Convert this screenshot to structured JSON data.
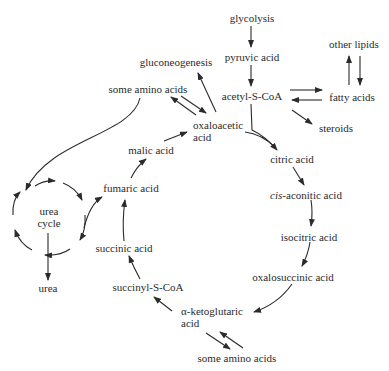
{
  "diagram": {
    "title": "",
    "nodes": {
      "glycolysis": "glycolysis",
      "pyruvic_acid": "pyruvic acid",
      "acetyl_scoa": "acetyl-S-CoA",
      "other_lipids": "other lipids",
      "fatty_acids": "fatty acids",
      "steroids": "steroids",
      "gluconeogenesis": "gluconeogenesis",
      "some_amino_acids_top": "some amino acids",
      "oxaloacetic_1": "oxaloacetic",
      "oxaloacetic_2": "acid",
      "citric_acid": "citric acid",
      "cis_prefix": "cis",
      "cis_aconitic": "-aconitic acid",
      "isocitric_acid": "isocitric acid",
      "oxalosuccinic_acid": "oxalosuccinic acid",
      "aketo_1": "α-ketoglutaric",
      "aketo_2": "acid",
      "some_amino_acids_bottom": "some amino acids",
      "succinyl_scoa": "succinyl-S-CoA",
      "succinic_acid": "succinic acid",
      "fumaric_acid": "fumaric acid",
      "malic_acid": "malic acid",
      "urea_cycle_1": "urea",
      "urea_cycle_2": "cycle",
      "urea": "urea"
    },
    "edges": [
      {
        "from": "glycolysis",
        "to": "pyruvic acid"
      },
      {
        "from": "pyruvic acid",
        "to": "acetyl-S-CoA"
      },
      {
        "from": "acetyl-S-CoA",
        "to": "fatty acids",
        "reversible": true
      },
      {
        "from": "fatty acids",
        "to": "other lipids",
        "reversible": true
      },
      {
        "from": "acetyl-S-CoA",
        "to": "steroids"
      },
      {
        "from": "acetyl-S-CoA",
        "to": "citric acid"
      },
      {
        "from": "oxaloacetic acid",
        "to": "citric acid"
      },
      {
        "from": "citric acid",
        "to": "cis-aconitic acid"
      },
      {
        "from": "cis-aconitic acid",
        "to": "isocitric acid"
      },
      {
        "from": "isocitric acid",
        "to": "oxalosuccinic acid"
      },
      {
        "from": "oxalosuccinic acid",
        "to": "α-ketoglutaric acid"
      },
      {
        "from": "α-ketoglutaric acid",
        "to": "some amino acids",
        "reversible": true
      },
      {
        "from": "α-ketoglutaric acid",
        "to": "succinyl-S-CoA"
      },
      {
        "from": "succinyl-S-CoA",
        "to": "succinic acid"
      },
      {
        "from": "succinic acid",
        "to": "fumaric acid"
      },
      {
        "from": "fumaric acid",
        "to": "malic acid"
      },
      {
        "from": "malic acid",
        "to": "oxaloacetic acid"
      },
      {
        "from": "oxaloacetic acid",
        "to": "gluconeogenesis"
      },
      {
        "from": "oxaloacetic acid",
        "to": "some amino acids",
        "reversible": true
      },
      {
        "from": "some amino acids",
        "to": "urea cycle"
      },
      {
        "from": "urea cycle",
        "to": "fumaric acid"
      },
      {
        "from": "urea cycle",
        "to": "urea"
      }
    ],
    "colors": {
      "ink": "#2b2b2b",
      "background": "#ffffff"
    }
  }
}
